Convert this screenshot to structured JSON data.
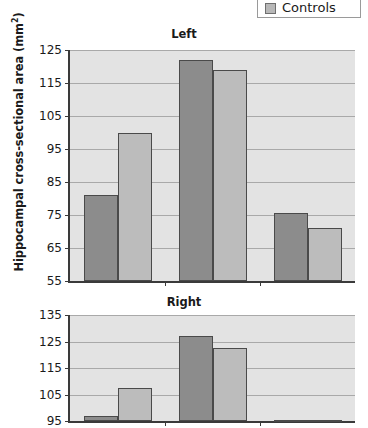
{
  "legend": {
    "items": [
      {
        "label": "Controls",
        "color": "#bcbcbc",
        "swatch_icon": "square-swatch-icon"
      }
    ]
  },
  "axis": {
    "ylabel_text": "Hippocampal cross-sectional area (mm",
    "ylabel_sup": "2",
    "ylabel_tail": ")",
    "ylabel_full": "Hippocampal cross-sectional area (mm²)"
  },
  "chart_data": [
    {
      "type": "bar",
      "title": "Left",
      "xlabel": "",
      "ylabel": "Hippocampal cross-sectional area (mm²)",
      "ylim": [
        55,
        125
      ],
      "yticks": [
        55,
        65,
        75,
        85,
        95,
        105,
        115,
        125
      ],
      "grid": true,
      "legend_position": "top-right",
      "categories": [
        "Group 1",
        "Group 2",
        "Group 3"
      ],
      "series": [
        {
          "name": "Patients",
          "color": "#8c8c8c",
          "values": [
            81,
            122,
            75.5
          ]
        },
        {
          "name": "Controls",
          "color": "#bcbcbc",
          "values": [
            100,
            119,
            71
          ]
        }
      ]
    },
    {
      "type": "bar",
      "title": "Right",
      "xlabel": "",
      "ylabel": "Hippocampal cross-sectional area (mm²)",
      "ylim": [
        95,
        135
      ],
      "yticks": [
        95,
        105,
        115,
        125,
        135
      ],
      "grid": true,
      "legend_position": "top-right",
      "categories": [
        "Group 1",
        "Group 2",
        "Group 3"
      ],
      "series": [
        {
          "name": "Patients",
          "color": "#8c8c8c",
          "values": [
            97,
            127,
            95.5
          ]
        },
        {
          "name": "Controls",
          "color": "#bcbcbc",
          "values": [
            107.5,
            122.5,
            95.2
          ]
        }
      ]
    }
  ]
}
